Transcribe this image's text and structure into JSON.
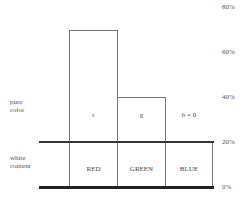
{
  "y_axis": {
    "ticks": [
      {
        "label": "80%",
        "y": 3
      },
      {
        "label": "60%",
        "y": 48
      },
      {
        "label": "40%",
        "y": 93
      },
      {
        "label": "20%",
        "y": 138
      },
      {
        "label": "0%",
        "y": 183
      }
    ]
  },
  "side_labels": {
    "pure_color": [
      "pure",
      "color"
    ],
    "white_content": [
      "white",
      "content"
    ]
  },
  "bars": {
    "red": {
      "top_label": "r",
      "bottom_label": "RED",
      "value_percent": 70
    },
    "green": {
      "top_label": "g",
      "bottom_label": "GREEN",
      "value_percent": 40
    },
    "blue": {
      "top_label": "b = 0",
      "bottom_label": "BLUE",
      "value_percent": 20
    }
  },
  "white_content_percent": 20
}
